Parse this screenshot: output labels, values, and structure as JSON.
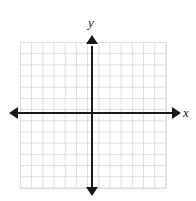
{
  "figure": {
    "name": "blank-cartesian-coordinate-grid",
    "width": 196,
    "height": 201,
    "background_color": "#ffffff"
  },
  "top_text_remnant": {
    "visible": true,
    "text": "                    ",
    "description": "clipped line of text at top edge, illegible"
  },
  "axes": {
    "x": {
      "label": "x",
      "color": "#1a1a1a",
      "arrow_left": true,
      "arrow_right": true
    },
    "y": {
      "label": "y",
      "color": "#1a1a1a",
      "arrow_up": true,
      "arrow_down": true
    },
    "origin_shown": true,
    "tick_labels": []
  },
  "grid": {
    "columns": 13,
    "rows": 13,
    "cell_size_px": 11.2,
    "line_color": "#dddde0",
    "background_color": "#ffffff"
  },
  "chart_data": {
    "type": "scatter",
    "title": "",
    "subtitle": "",
    "xlabel": "x",
    "ylabel": "y",
    "xlim": [
      -6,
      7
    ],
    "ylim": [
      -7,
      6
    ],
    "xticks": [],
    "yticks": [],
    "grid": true,
    "legend": null,
    "series": [],
    "annotations": [],
    "note": "Empty coordinate plane: 13 x 13 unit grid with arrowed x and y axes, no plotted data points or curves, no numeric tick labels."
  }
}
